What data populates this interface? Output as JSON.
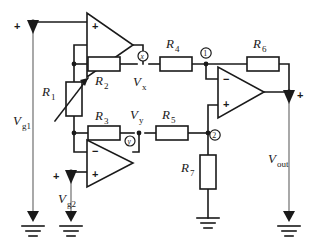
{
  "figure": {
    "type": "circuit-schematic",
    "background_color": "#ffffff",
    "line_color": "#1a1a1a",
    "thin_line_color": "#6f6f6f"
  },
  "sources": [
    {
      "id": "vg1",
      "label_main": "V",
      "label_sub": "g1",
      "polarity": "+",
      "symbol": "voltage-source-arrow"
    },
    {
      "id": "vg2",
      "label_main": "V",
      "label_sub": "g2",
      "polarity": "+",
      "symbol": "voltage-source-arrow"
    },
    {
      "id": "vout",
      "label_main": "V",
      "label_sub": "out",
      "polarity": "+",
      "symbol": "voltage-source-arrow"
    }
  ],
  "resistors": [
    {
      "id": "r1",
      "label_main": "R",
      "label_sub": "1",
      "orientation": "vertical",
      "variable": true
    },
    {
      "id": "r2",
      "label_main": "R",
      "label_sub": "2",
      "orientation": "horizontal",
      "variable": false
    },
    {
      "id": "r3",
      "label_main": "R",
      "label_sub": "3",
      "orientation": "horizontal",
      "variable": false
    },
    {
      "id": "r4",
      "label_main": "R",
      "label_sub": "4",
      "orientation": "horizontal",
      "variable": false
    },
    {
      "id": "r5",
      "label_main": "R",
      "label_sub": "5",
      "orientation": "horizontal",
      "variable": false
    },
    {
      "id": "r6",
      "label_main": "R",
      "label_sub": "6",
      "orientation": "horizontal",
      "variable": false
    },
    {
      "id": "r7",
      "label_main": "R",
      "label_sub": "7",
      "orientation": "vertical",
      "variable": false
    }
  ],
  "opamps": [
    {
      "id": "opamp-top",
      "top_input": "+",
      "bottom_input": "−",
      "orientation": "right"
    },
    {
      "id": "opamp-bottom",
      "top_input": "−",
      "bottom_input": "+",
      "orientation": "right"
    },
    {
      "id": "opamp-output",
      "top_input": "−",
      "bottom_input": "+",
      "orientation": "right"
    }
  ],
  "node_labels": [
    {
      "id": "node-x",
      "marker": "x",
      "marker_style": "circled",
      "text_main": "V",
      "text_sub": "x"
    },
    {
      "id": "node-y",
      "marker": "y",
      "marker_style": "circled",
      "text_main": "V",
      "text_sub": "y"
    },
    {
      "id": "node-1",
      "marker": "1",
      "marker_style": "circled"
    },
    {
      "id": "node-2",
      "marker": "2",
      "marker_style": "circled"
    }
  ],
  "grounds": [
    {
      "id": "ground-vg1"
    },
    {
      "id": "ground-vg2"
    },
    {
      "id": "ground-r7"
    },
    {
      "id": "ground-vout"
    }
  ]
}
